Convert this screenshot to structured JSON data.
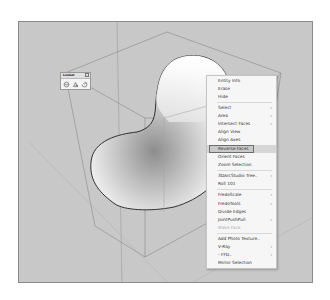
{
  "toolbar": {
    "title": "Lookat",
    "icons": [
      "camera-orbit-icon",
      "look-around-icon",
      "rotate-view-icon"
    ]
  },
  "context_menu": {
    "items": [
      {
        "label": "Entity Info",
        "submenu": false
      },
      {
        "label": "Erase",
        "submenu": false
      },
      {
        "label": "Hide",
        "submenu": false
      },
      {
        "separator": true
      },
      {
        "label": "Select",
        "submenu": true
      },
      {
        "label": "Area",
        "submenu": true
      },
      {
        "label": "Intersect Faces",
        "submenu": true
      },
      {
        "label": "Align View",
        "submenu": false
      },
      {
        "label": "Align Axes",
        "submenu": false
      },
      {
        "label": "Reverse Faces",
        "submenu": false,
        "highlighted": true
      },
      {
        "label": "Orient Faces",
        "submenu": false
      },
      {
        "label": "Zoom Selection",
        "submenu": false
      },
      {
        "separator": true
      },
      {
        "label": "3DArcStudio Tree..",
        "submenu": true
      },
      {
        "label": "Roll 101",
        "submenu": false
      },
      {
        "separator": true
      },
      {
        "label": "FredoScale",
        "submenu": true
      },
      {
        "label": "FredoTools",
        "submenu": true
      },
      {
        "label": "Divide Edges",
        "submenu": false
      },
      {
        "label": "JointPushPull",
        "submenu": true
      },
      {
        "label": "Make Face",
        "submenu": false,
        "disabled": true
      },
      {
        "separator": true
      },
      {
        "label": "Add Photo Texture..",
        "submenu": false
      },
      {
        "label": "V-Ray",
        "submenu": true
      },
      {
        "label": "- FFD..",
        "submenu": true
      },
      {
        "label": "Mirror Selection",
        "submenu": false
      }
    ],
    "arrow_glyph": "›"
  },
  "colors": {
    "viewport_bg": "#c8c8c8",
    "menu_bg": "#f6f6f6",
    "highlight": "#d6d6d6"
  }
}
